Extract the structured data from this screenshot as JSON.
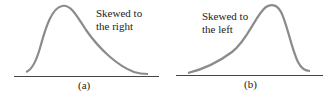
{
  "colors": {
    "curve": "#8c8a8f",
    "axis": "#444444",
    "text": "#222222"
  },
  "panels": [
    {
      "id": "a",
      "caption": "(a)",
      "label_line1": "Skewed to",
      "label_line2": "the right"
    },
    {
      "id": "b",
      "caption": "(b)",
      "label_line1": "Skewed to",
      "label_line2": "the left"
    }
  ]
}
